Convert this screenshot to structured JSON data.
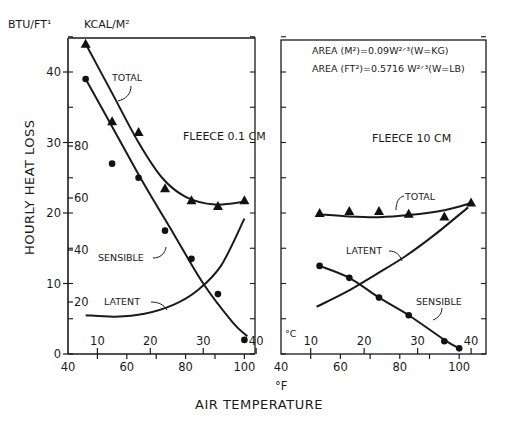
{
  "figure": {
    "ylabel": "HOURLY HEAT LOSS",
    "y_units_left": "BTU/FT¹",
    "y_units_right": "KCAL/M²",
    "x_unit_f": "°F",
    "x_unit_c": "°C",
    "xlabel": "AIR TEMPERATURE",
    "area_formula_1": "AREA (M²)=0.09W²ᐟ³(W=KG)",
    "area_formula_2": "AREA (FT²)=0.5716 W²ᐟ³(W=LB)"
  },
  "chart_data": [
    {
      "type": "line",
      "title": "FLEECE 0.1 CM",
      "xlabel": "AIR TEMPERATURE (°F)",
      "ylabel": "HOURLY HEAT LOSS (BTU/FT²)",
      "xlim": [
        40,
        104
      ],
      "ylim": [
        0,
        45
      ],
      "x_ticks_f": [
        40,
        60,
        80,
        100
      ],
      "x_ticks_c": [
        10,
        20,
        30,
        40
      ],
      "y_ticks_btu": [
        0,
        10,
        20,
        30,
        40
      ],
      "y_ticks_kcal": [
        20,
        40,
        60,
        80
      ],
      "grid": false,
      "series": [
        {
          "name": "TOTAL",
          "marker": "triangle",
          "points": [
            [
              46,
              44
            ],
            [
              55,
              33
            ],
            [
              64,
              31.5
            ],
            [
              73,
              23.5
            ],
            [
              82,
              21.8
            ],
            [
              91,
              21
            ],
            [
              100,
              21.8
            ]
          ],
          "curve": [
            [
              46,
              44
            ],
            [
              55,
              37
            ],
            [
              64,
              30
            ],
            [
              72,
              25
            ],
            [
              80,
              22.3
            ],
            [
              90,
              21.2
            ],
            [
              100,
              21.6
            ]
          ]
        },
        {
          "name": "SENSIBLE",
          "marker": "circle",
          "points": [
            [
              46,
              39
            ],
            [
              55,
              27
            ],
            [
              64,
              25
            ],
            [
              73,
              17.5
            ],
            [
              82,
              13.5
            ],
            [
              91,
              8.5
            ],
            [
              100,
              2
            ]
          ],
          "curve": [
            [
              46,
              39
            ],
            [
              56,
              31.5
            ],
            [
              66,
              24
            ],
            [
              76,
              17
            ],
            [
              86,
              10
            ],
            [
              96,
              4.5
            ],
            [
              101,
              2.5
            ]
          ]
        },
        {
          "name": "LATENT",
          "marker": "none",
          "curve": [
            [
              46,
              5.5
            ],
            [
              56,
              5.3
            ],
            [
              66,
              5.7
            ],
            [
              76,
              7
            ],
            [
              84,
              9
            ],
            [
              92,
              12.5
            ],
            [
              100,
              19.2
            ]
          ]
        }
      ],
      "annotations": [
        "TOTAL",
        "SENSIBLE",
        "LATENT",
        "FLEECE 0.1 CM"
      ]
    },
    {
      "type": "line",
      "title": "FLEECE 10 CM",
      "xlabel": "AIR TEMPERATURE (°F)",
      "ylabel": "HOURLY HEAT LOSS (BTU/FT²)",
      "xlim": [
        40,
        109
      ],
      "ylim": [
        0,
        45
      ],
      "x_ticks_f": [
        40,
        60,
        80,
        100
      ],
      "x_ticks_c": [
        10,
        20,
        30,
        40
      ],
      "grid": false,
      "series": [
        {
          "name": "TOTAL",
          "marker": "triangle",
          "points": [
            [
              53,
              20
            ],
            [
              63,
              20.3
            ],
            [
              73,
              20.3
            ],
            [
              83,
              19.9
            ],
            [
              95,
              19.5
            ],
            [
              104,
              21.5
            ]
          ],
          "curve": [
            [
              53,
              19.8
            ],
            [
              63,
              19.5
            ],
            [
              73,
              19.4
            ],
            [
              83,
              19.7
            ],
            [
              95,
              20.4
            ],
            [
              104,
              21.4
            ]
          ]
        },
        {
          "name": "SENSIBLE",
          "marker": "circle",
          "points": [
            [
              53,
              12.5
            ],
            [
              63,
              10.8
            ],
            [
              73,
              8
            ],
            [
              83,
              5.5
            ],
            [
              95,
              1.8
            ],
            [
              100,
              0.8
            ]
          ],
          "curve": [
            [
              53,
              12.5
            ],
            [
              63,
              10.8
            ],
            [
              73,
              8
            ],
            [
              83,
              5.5
            ],
            [
              95,
              2
            ],
            [
              100,
              0.8
            ]
          ]
        },
        {
          "name": "LATENT",
          "marker": "none",
          "curve": [
            [
              52,
              6.7
            ],
            [
              62,
              8.8
            ],
            [
              72,
              11.3
            ],
            [
              82,
              13.9
            ],
            [
              92,
              17
            ],
            [
              103,
              20.8
            ]
          ]
        }
      ],
      "annotations": [
        "TOTAL",
        "LATENT",
        "SENSIBLE",
        "FLEECE 10 CM"
      ]
    }
  ],
  "panels": {
    "left": {
      "label": "FLEECE 0.1 CM",
      "total": "TOTAL",
      "sensible": "SENSIBLE",
      "latent": "LATENT"
    },
    "right": {
      "label": "FLEECE 10 CM",
      "total": "TOTAL",
      "sensible": "SENSIBLE",
      "latent": "LATENT"
    }
  },
  "ticks": {
    "btu": [
      "0",
      "10",
      "20",
      "30",
      "40"
    ],
    "kcal": [
      "20",
      "40",
      "60",
      "80"
    ],
    "f": [
      "40",
      "60",
      "80",
      "100"
    ],
    "c": [
      "10",
      "20",
      "30",
      "40"
    ]
  }
}
